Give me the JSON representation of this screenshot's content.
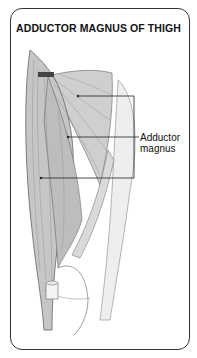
{
  "figure": {
    "title": "ADDUCTOR MAGNUS OF THIGH",
    "labels": [
      {
        "line1": "Adductor",
        "line2": "magnus"
      }
    ]
  },
  "colors": {
    "border": "#333333",
    "muscle_fill": "#c9c9c9",
    "muscle_light": "#e4e4e4",
    "line": "#222222"
  }
}
